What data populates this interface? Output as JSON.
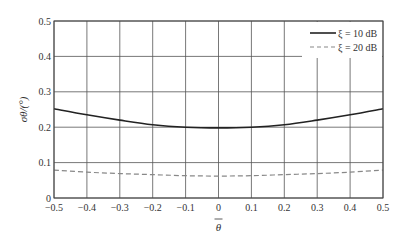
{
  "chart_data": {
    "type": "line",
    "title": "",
    "xlabel": "θ̄",
    "ylabel": "σθ/(°)",
    "xlim": [
      -0.5,
      0.5
    ],
    "ylim": [
      0,
      0.5
    ],
    "grid": true,
    "legend_position": "top-right",
    "x_ticks": [
      "-0.5",
      "-0.4",
      "-0.3",
      "-0.2",
      "-0.1",
      "0",
      "0.1",
      "0.2",
      "0.3",
      "0.4",
      "0.5"
    ],
    "y_ticks": [
      "0",
      "0.1",
      "0.2",
      "0.3",
      "0.4",
      "0.5"
    ],
    "x": [
      -0.5,
      -0.4,
      -0.3,
      -0.2,
      -0.1,
      0,
      0.1,
      0.2,
      0.3,
      0.4,
      0.5
    ],
    "series": [
      {
        "name": "ξ = 10 dB",
        "style": "solid",
        "color": "#222222",
        "values": [
          0.252,
          0.235,
          0.22,
          0.207,
          0.2,
          0.198,
          0.2,
          0.207,
          0.22,
          0.235,
          0.252
        ]
      },
      {
        "name": "ξ = 20 dB",
        "style": "dashed",
        "color": "#888888",
        "values": [
          0.079,
          0.073,
          0.069,
          0.066,
          0.063,
          0.062,
          0.063,
          0.066,
          0.069,
          0.073,
          0.079
        ]
      }
    ]
  }
}
